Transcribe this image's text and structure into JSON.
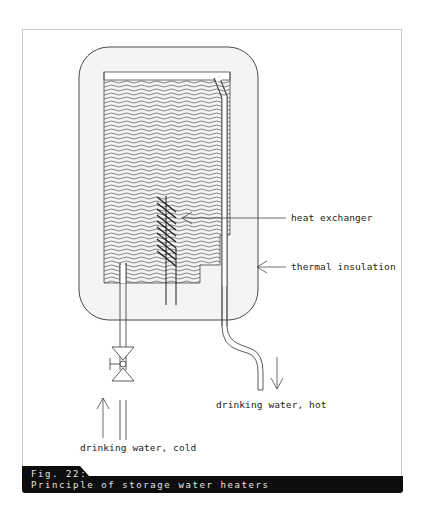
{
  "figure": {
    "number_label": "Fig. 22:",
    "caption": "Principle of storage water heaters",
    "title": "Principle of storage water heaters"
  },
  "labels": {
    "heat_exchanger": "heat exchanger",
    "thermal_insulation": "thermal insulation",
    "drinking_water_hot": "drinking water, hot",
    "drinking_water_cold": "drinking water, cold"
  },
  "colors": {
    "line": "#4a4a4a",
    "insulation_fill": "#f4f4f4",
    "frame_border": "#c8c8c8",
    "caption_bg": "#0d0d0d",
    "caption_text": "#e6e6e6"
  },
  "components": [
    {
      "name": "thermal insulation",
      "shape": "rounded rectangle"
    },
    {
      "name": "storage tank",
      "fill": "wavy lines (water)"
    },
    {
      "name": "heat exchanger",
      "shape": "coil with two vertical leads"
    },
    {
      "name": "hot water outlet pipe",
      "flow": "down"
    },
    {
      "name": "cold water inlet pipe",
      "flow": "up",
      "fitting": "valve"
    }
  ]
}
